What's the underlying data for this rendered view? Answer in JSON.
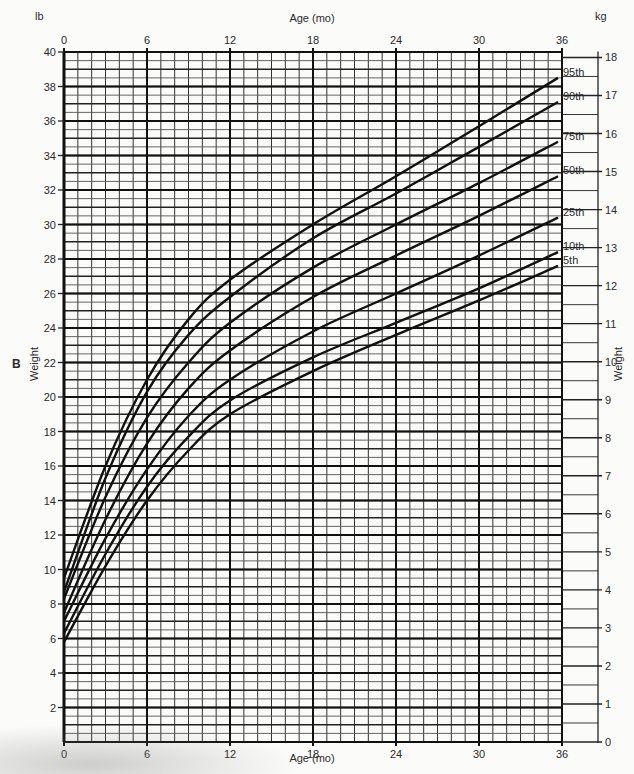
{
  "header": {
    "top_axis_title": "Age (mo)",
    "left_unit": "lb",
    "right_unit": "kg"
  },
  "panel_label": "B",
  "footer": {
    "bottom_axis_title": "Age (mo)"
  },
  "left_axis_title": "Weight",
  "right_axis_title": "Weight",
  "chart_data": {
    "type": "line",
    "title": "",
    "xlabel": "Age (mo)",
    "ylabel": "Weight (lb)",
    "ylabel_secondary": "Weight (kg)",
    "xlim": [
      0,
      36
    ],
    "ylim": [
      0,
      40
    ],
    "ylim_secondary": [
      0,
      18
    ],
    "grid": true,
    "x_ticks": [
      0,
      6,
      12,
      18,
      24,
      30,
      36
    ],
    "y_ticks": [
      2,
      4,
      6,
      8,
      10,
      12,
      14,
      16,
      18,
      20,
      22,
      24,
      26,
      28,
      30,
      32,
      34,
      36,
      38,
      40
    ],
    "y_ticks_secondary": [
      0,
      1,
      2,
      3,
      4,
      5,
      6,
      7,
      8,
      9,
      10,
      11,
      12,
      13,
      14,
      15,
      16,
      17,
      18
    ],
    "legend_position": "right end of curves",
    "x": [
      0,
      3,
      6,
      9,
      12,
      18,
      24,
      30,
      36
    ],
    "series": [
      {
        "name": "95th",
        "values": [
          9.5,
          16.0,
          21.0,
          24.5,
          26.8,
          30.0,
          32.8,
          35.7,
          38.5
        ]
      },
      {
        "name": "90th",
        "values": [
          8.7,
          15.3,
          20.3,
          23.6,
          25.8,
          29.2,
          31.8,
          34.5,
          37.1
        ]
      },
      {
        "name": "75th",
        "values": [
          8.3,
          14.2,
          18.8,
          22.0,
          24.3,
          27.5,
          30.0,
          32.4,
          34.8
        ]
      },
      {
        "name": "50th",
        "values": [
          7.5,
          12.9,
          17.3,
          20.5,
          22.7,
          25.8,
          28.2,
          30.5,
          32.8
        ]
      },
      {
        "name": "25th",
        "values": [
          7.0,
          11.8,
          15.8,
          18.9,
          21.0,
          23.8,
          26.0,
          28.2,
          30.4
        ]
      },
      {
        "name": "10th",
        "values": [
          6.3,
          10.9,
          14.8,
          17.7,
          19.8,
          22.3,
          24.3,
          26.3,
          28.4
        ]
      },
      {
        "name": "5th",
        "values": [
          5.8,
          10.2,
          14.0,
          16.9,
          19.0,
          21.5,
          23.6,
          25.6,
          27.6
        ]
      }
    ]
  }
}
